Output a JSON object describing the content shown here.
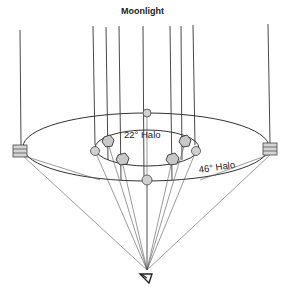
{
  "diagram": {
    "title": "Moonlight",
    "labels": {
      "halo_22": "22° Halo",
      "halo_46": "46° Halo"
    },
    "elements": {
      "light_rays": "vertical parallel moonlight rays",
      "inner_ring": "22° halo ring with hexagonal ice crystals",
      "outer_ring": "46° halo ring with square/plate ice crystals at sides",
      "observer": "eye symbol at apex of cone"
    },
    "colors": {
      "line": "#333333",
      "crystal_fill": "#cfcfcf",
      "background": "#ffffff"
    }
  }
}
